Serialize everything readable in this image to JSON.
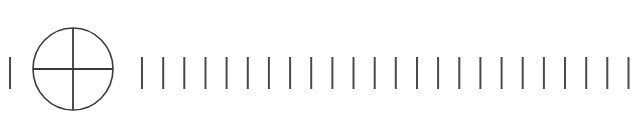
{
  "figure": {
    "type": "line-drawing",
    "canvas": {
      "width": 638,
      "height": 136,
      "background_color": "#ffffff"
    },
    "stroke": {
      "color": "#3a3a3a",
      "tick_color": "#4a4a4a",
      "circle_color": "#3c3c3c",
      "tick_width": 2.0,
      "circle_width": 1.6,
      "cross_width": 1.8
    },
    "lead_tick": {
      "name": "lead-tick",
      "x": 10,
      "y_top": 57,
      "y_bottom": 89,
      "length": 32
    },
    "crosshair_circle": {
      "name": "crosshair-circle",
      "center_x": 73,
      "center_y": 69,
      "radius_x": 40,
      "radius_y": 41,
      "horizontal_line": {
        "x1": 33,
        "x2": 113,
        "y": 69
      },
      "vertical_line": {
        "x": 73,
        "y1": 28,
        "y2": 110
      }
    },
    "tick_scale": {
      "name": "tick-scale",
      "count": 24,
      "first_x": 142,
      "spacing": 21.15,
      "y_top": 57,
      "y_bottom": 89,
      "length": 32,
      "positions": [
        142.0,
        163.2,
        184.3,
        205.5,
        226.6,
        247.8,
        268.9,
        290.1,
        311.2,
        332.4,
        353.5,
        374.7,
        395.8,
        417.0,
        438.1,
        459.3,
        480.4,
        501.6,
        522.7,
        543.9,
        565.0,
        586.2,
        607.3,
        628.5
      ]
    }
  }
}
